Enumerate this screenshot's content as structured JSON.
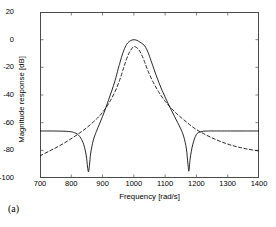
{
  "figure": {
    "caption": "(a)"
  },
  "axes": {
    "xlabel": "Frequency [rad/s]",
    "ylabel": "Magnitude response [dB]",
    "xticks": [
      "700",
      "800",
      "900",
      "1000",
      "1100",
      "1200",
      "1300",
      "1400"
    ],
    "yticks": [
      "20",
      "0",
      "-20",
      "-40",
      "-60",
      "-80",
      "-100"
    ],
    "xlim": [
      700,
      1400
    ],
    "ylim": [
      -100,
      20
    ]
  },
  "chart_data": {
    "type": "line",
    "title": "",
    "xlabel": "Frequency [rad/s]",
    "ylabel": "Magnitude response [dB]",
    "xlim": [
      700,
      1400
    ],
    "ylim": [
      -100,
      20
    ],
    "xticks": [
      700,
      800,
      900,
      1000,
      1100,
      1200,
      1300,
      1400
    ],
    "yticks": [
      20,
      0,
      -20,
      -40,
      -60,
      -80,
      -100
    ],
    "grid": false,
    "legend": null,
    "series": [
      {
        "name": "solid",
        "style": "solid",
        "color": "#000000",
        "notches": [
          855,
          1175
        ],
        "stopband_level": -66,
        "passband_level": 0,
        "x": [
          700,
          720,
          740,
          760,
          780,
          800,
          810,
          820,
          830,
          840,
          848,
          852,
          855,
          858,
          862,
          870,
          880,
          890,
          900,
          910,
          920,
          930,
          940,
          950,
          955,
          960,
          965,
          970,
          975,
          980,
          990,
          1000,
          1010,
          1020,
          1025,
          1030,
          1035,
          1040,
          1045,
          1050,
          1060,
          1070,
          1080,
          1090,
          1100,
          1110,
          1120,
          1130,
          1140,
          1150,
          1160,
          1168,
          1173,
          1176,
          1180,
          1188,
          1200,
          1215,
          1230,
          1250,
          1280,
          1320,
          1360,
          1400
        ],
        "y": [
          -66.0,
          -66.0,
          -66.0,
          -66.1,
          -66.2,
          -66.6,
          -67.2,
          -68.4,
          -71.0,
          -76.0,
          -84.0,
          -92.0,
          -95.5,
          -91.0,
          -82.0,
          -73.0,
          -66.5,
          -61.0,
          -55.5,
          -49.5,
          -43.0,
          -36.5,
          -29.5,
          -21.0,
          -17.0,
          -13.0,
          -9.5,
          -6.5,
          -4.2,
          -2.4,
          -0.6,
          -0.05,
          -0.5,
          -1.9,
          -2.6,
          -3.4,
          -4.6,
          -6.4,
          -9.0,
          -12.0,
          -18.5,
          -25.0,
          -31.0,
          -36.5,
          -41.5,
          -46.5,
          -51.0,
          -55.5,
          -60.0,
          -64.5,
          -70.5,
          -79.0,
          -90.0,
          -95.0,
          -86.0,
          -76.0,
          -68.5,
          -66.5,
          -66.1,
          -66.0,
          -66.0,
          -66.0,
          -66.0,
          -66.0
        ]
      },
      {
        "name": "dashed",
        "style": "dashed",
        "color": "#000000",
        "peak_level": -5,
        "x": [
          700,
          730,
          760,
          790,
          820,
          850,
          880,
          900,
          920,
          940,
          955,
          965,
          975,
          985,
          995,
          1000,
          1005,
          1015,
          1025,
          1035,
          1045,
          1060,
          1080,
          1100,
          1130,
          1160,
          1200,
          1250,
          1300,
          1350,
          1400
        ],
        "y": [
          -84.0,
          -80.5,
          -77.0,
          -73.0,
          -68.5,
          -63.5,
          -57.5,
          -52.5,
          -46.0,
          -37.5,
          -29.0,
          -22.0,
          -15.0,
          -9.5,
          -6.0,
          -5.1,
          -5.2,
          -7.0,
          -11.0,
          -16.5,
          -22.5,
          -30.0,
          -38.0,
          -44.5,
          -52.0,
          -58.0,
          -65.0,
          -71.0,
          -75.5,
          -78.5,
          -80.5
        ]
      }
    ]
  }
}
